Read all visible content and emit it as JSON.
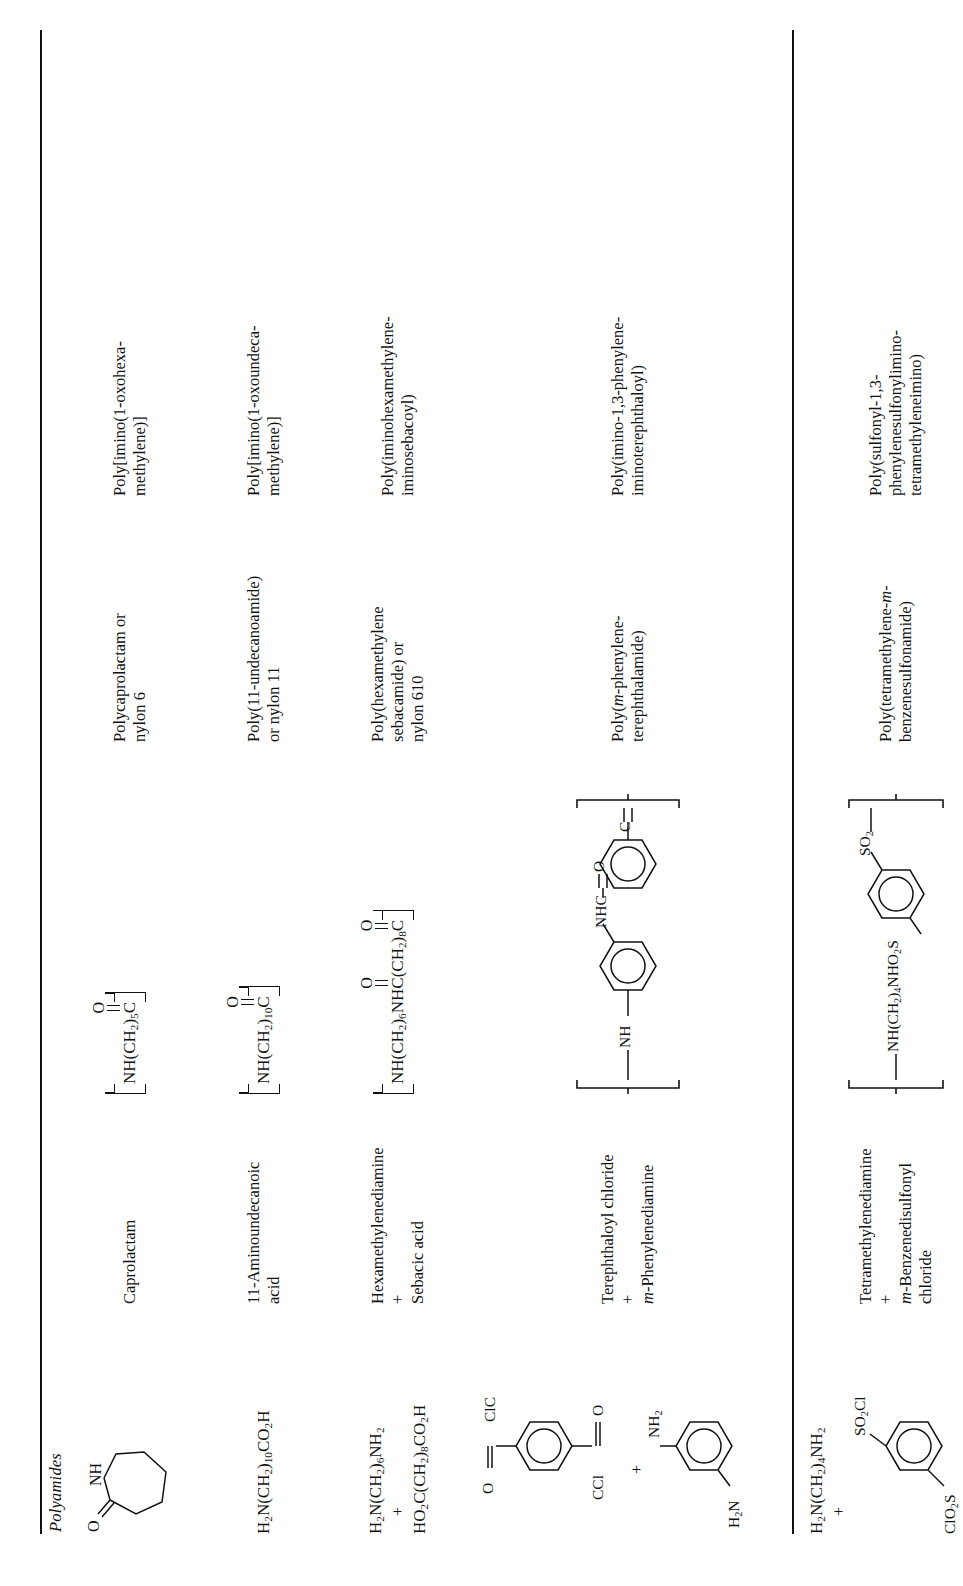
{
  "section": {
    "title": "Polyamides"
  },
  "columns": {
    "monomer_structure": "monomer structure",
    "monomer_name": "monomer name",
    "repeat_unit": "repeat unit structure",
    "common_name": "common name",
    "source_name": "source-based / IUPAC name"
  },
  "rows": [
    {
      "monomer_structure_kind": "caprolactam-ring",
      "monomer_structure_labels": {
        "o": "O",
        "nh": "NH"
      },
      "monomer_name": [
        "Caprolactam"
      ],
      "repeat_unit_kind": "chain",
      "repeat_unit_text": "NH(CH2)5C",
      "repeat_unit_parts": {
        "pre": "NH(CH",
        "sub1": "2",
        "mid": ")",
        "sub2": "5",
        "post": "C",
        "carbonyl_o": "O"
      },
      "common_name": [
        "Polycaprolactam or",
        "nylon 6"
      ],
      "source_name": [
        "Poly[imino(1-oxohexa-",
        "methylene)]"
      ]
    },
    {
      "monomer_structure_kind": "formula",
      "monomer_formula": [
        {
          "pre": "H",
          "sub1": "2",
          "mid": "N(CH",
          "sub2": "2",
          "mid2": ")",
          "sub3": "10",
          "post": "CO",
          "sub4": "2",
          "end": "H"
        }
      ],
      "monomer_name": [
        "11-Aminoundecanoic",
        "acid"
      ],
      "repeat_unit_kind": "chain",
      "repeat_unit_text": "NH(CH2)10C",
      "repeat_unit_parts": {
        "pre": "NH(CH",
        "sub1": "2",
        "mid": ")",
        "sub2": "10",
        "post": "C",
        "carbonyl_o": "O"
      },
      "common_name": [
        "Poly(11-undecanoamide)",
        "or nylon 11"
      ],
      "source_name": [
        "Poly[imino(1-oxoundeca-",
        "methylene)]"
      ]
    },
    {
      "monomer_structure_kind": "formula-pair",
      "monomer_formula_lines": [
        "H2N(CH2)6NH2",
        "+",
        "HO2C(CH2)8CO2H"
      ],
      "monomer_name": [
        "Hexamethylenediamine",
        "+",
        "Sebacic acid"
      ],
      "monomer_name_bold": [
        true,
        false,
        false
      ],
      "repeat_unit_kind": "chain-diacid",
      "repeat_unit_text": "NH(CH2)6NHC(CH2)8C",
      "common_name": [
        "Poly(hexamethylene",
        "sebacamide) or",
        "nylon 610"
      ],
      "source_name": [
        "Poly(iminohexamethylene-",
        "iminosebacoyl)"
      ]
    },
    {
      "monomer_structure_kind": "aryl-pair",
      "monomer_structure_labels": {
        "acid_chloride_top": "ClC",
        "acid_chloride_bottom": "CCl",
        "acid_chloride_o": "O",
        "amine_top": "H2N",
        "amine_bottom": "NH2",
        "plus": "+"
      },
      "monomer_name": [
        "Terephthaloyl chloride",
        "+",
        "m-Phenylenediamine"
      ],
      "monomer_name_italic_prefix": [
        null,
        null,
        "m"
      ],
      "repeat_unit_kind": "aramid",
      "repeat_unit_labels": {
        "top_c": "C",
        "top_o": "O",
        "nhc": "NHC",
        "mid_o": "O",
        "nh": "NH"
      },
      "common_name": [
        "Poly(m-phenylene-",
        "terephthalamide)"
      ],
      "common_name_italic": [
        "m"
      ],
      "source_name": [
        "Poly(imino-1,3-phenylene-",
        "iminoterephthaloyl)"
      ]
    },
    {
      "monomer_structure_kind": "amine-sulfonyl-pair",
      "monomer_structure_labels": {
        "amine": "H2N(CH2)4NH2",
        "plus": "+",
        "sulfonyl_top": "SO2Cl",
        "sulfonyl_bottom": "ClO2S"
      },
      "monomer_name": [
        "Tetramethylenediamine",
        "+",
        "m-Benzenedisulfonyl",
        "chloride"
      ],
      "monomer_name_italic_prefix": [
        null,
        null,
        "m",
        null
      ],
      "repeat_unit_kind": "sulfonamide",
      "repeat_unit_labels": {
        "chain": "NH(CH2)4NHO2S",
        "so2": "SO2"
      },
      "common_name": [
        "Poly(tetramethylene-m-",
        "benzenesulfonamide)"
      ],
      "common_name_italic": [
        "m"
      ],
      "source_name": [
        "Poly(sulfonyl-1,3-",
        "phenylenesulfonylimino-",
        "tetramethyleneimino)"
      ]
    }
  ]
}
